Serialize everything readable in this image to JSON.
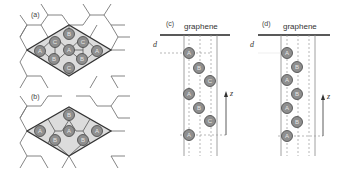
{
  "figure": {
    "panels": [
      {
        "id": "a",
        "label": "(a)",
        "type": "top-view",
        "atoms": [
          "B",
          "C",
          "C",
          "A",
          "A",
          "A",
          "B",
          "B",
          "C"
        ]
      },
      {
        "id": "b",
        "label": "(b)",
        "type": "top-view",
        "atoms": [
          "B",
          "A",
          "A",
          "A",
          "B",
          "B"
        ]
      },
      {
        "id": "c",
        "label": "(c)",
        "surface_label": "graphene",
        "distance_label": "d",
        "axis_label": "z",
        "stacking": [
          "A",
          "B",
          "C",
          "A",
          "B",
          "C",
          "A"
        ]
      },
      {
        "id": "d",
        "label": "(d)",
        "surface_label": "graphene",
        "distance_label": "d",
        "axis_label": "z",
        "stacking": [
          "A",
          "B",
          "A",
          "B",
          "A",
          "B",
          "A"
        ]
      }
    ]
  }
}
